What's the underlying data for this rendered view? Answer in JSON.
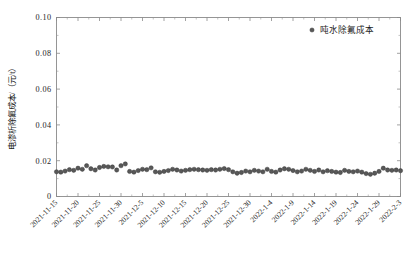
{
  "chart_data": {
    "type": "scatter",
    "title": "",
    "xlabel": "",
    "ylabel": "电渗析除氟成本/（元/t）",
    "ylim": [
      0,
      0.1
    ],
    "yticks": [
      0,
      0.02,
      0.04,
      0.06,
      0.08,
      0.1
    ],
    "ytick_labels": [
      "0",
      "0.02",
      "0.04",
      "0.06",
      "0.08",
      "0.10"
    ],
    "grid": false,
    "legend_position": "top-right",
    "series": [
      {
        "name": "吨水除氟成本",
        "marker": "circle",
        "color": "#585858",
        "x": [
          "2021-11-15",
          "2021-11-16",
          "2021-11-17",
          "2021-11-18",
          "2021-11-19",
          "2021-11-20",
          "2021-11-21",
          "2021-11-22",
          "2021-11-23",
          "2021-11-24",
          "2021-11-25",
          "2021-11-26",
          "2021-11-27",
          "2021-11-28",
          "2021-11-29",
          "2021-11-30",
          "2021-12-1",
          "2021-12-2",
          "2021-12-3",
          "2021-12-4",
          "2021-12-5",
          "2021-12-6",
          "2021-12-7",
          "2021-12-8",
          "2021-12-9",
          "2021-12-10",
          "2021-12-11",
          "2021-12-12",
          "2021-12-13",
          "2021-12-14",
          "2021-12-15",
          "2021-12-16",
          "2021-12-17",
          "2021-12-18",
          "2021-12-19",
          "2021-12-20",
          "2021-12-21",
          "2021-12-22",
          "2021-12-23",
          "2021-12-24",
          "2021-12-25",
          "2021-12-26",
          "2021-12-27",
          "2021-12-28",
          "2021-12-29",
          "2021-12-30",
          "2021-12-31",
          "2022-1-1",
          "2022-1-2",
          "2022-1-3",
          "2022-1-4",
          "2022-1-5",
          "2022-1-6",
          "2022-1-7",
          "2022-1-8",
          "2022-1-9",
          "2022-1-10",
          "2022-1-11",
          "2022-1-12",
          "2022-1-13",
          "2022-1-14",
          "2022-1-15",
          "2022-1-16",
          "2022-1-17",
          "2022-1-18",
          "2022-1-19",
          "2022-1-20",
          "2022-1-21",
          "2022-1-22",
          "2022-1-23",
          "2022-1-24",
          "2022-1-25",
          "2022-1-26",
          "2022-1-27",
          "2022-1-28",
          "2022-1-29",
          "2022-1-30",
          "2022-1-31",
          "2022-2-1",
          "2022-2-2",
          "2022-2-3"
        ],
        "values": [
          0.0138,
          0.0136,
          0.0142,
          0.015,
          0.0146,
          0.0158,
          0.0152,
          0.0172,
          0.0155,
          0.0148,
          0.0162,
          0.0168,
          0.0166,
          0.0165,
          0.0148,
          0.0172,
          0.0182,
          0.014,
          0.0136,
          0.0145,
          0.0152,
          0.015,
          0.016,
          0.0138,
          0.0135,
          0.014,
          0.0145,
          0.0152,
          0.0148,
          0.0142,
          0.0146,
          0.015,
          0.0152,
          0.015,
          0.0148,
          0.0146,
          0.015,
          0.0148,
          0.0152,
          0.0156,
          0.015,
          0.0138,
          0.013,
          0.0134,
          0.0142,
          0.0138,
          0.0146,
          0.0142,
          0.0138,
          0.0152,
          0.014,
          0.0136,
          0.0148,
          0.0155,
          0.0152,
          0.0145,
          0.0138,
          0.0142,
          0.0152,
          0.0146,
          0.014,
          0.0148,
          0.0138,
          0.0144,
          0.014,
          0.0136,
          0.0134,
          0.0146,
          0.014,
          0.0138,
          0.0142,
          0.0136,
          0.0128,
          0.0124,
          0.013,
          0.014,
          0.0158,
          0.0148,
          0.0146,
          0.0148,
          0.0144
        ]
      }
    ],
    "xtick_labels": [
      "2021-11-15",
      "2021-11-20",
      "2021-11-25",
      "2021-11-30",
      "2021-12-5",
      "2021-12-10",
      "2021-12-15",
      "2021-12-20",
      "2021-12-25",
      "2021-12-30",
      "2022-1-4",
      "2022-1-9",
      "2022-1-14",
      "2022-1-19",
      "2022-1-24",
      "2022-1-29",
      "2022-2-3"
    ]
  },
  "legend": {
    "label": "吨水除氟成本"
  },
  "axes": {
    "y_title": "电渗析除氟成本/（元/t）"
  }
}
